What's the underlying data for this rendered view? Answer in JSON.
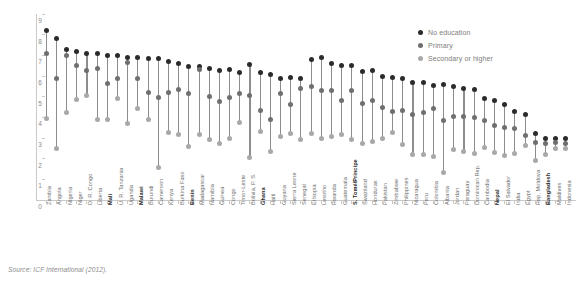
{
  "source_note": "Source: ICF International (2012).",
  "legend": {
    "position": "top-right",
    "entries": [
      {
        "label": "No education",
        "color": "#2b2b2b",
        "key": "no_education"
      },
      {
        "label": "Primary",
        "color": "#6f6f6f",
        "key": "primary"
      },
      {
        "label": "Secondary or higher",
        "color": "#a8a8a8",
        "key": "secondary_or_higher"
      }
    ]
  },
  "chart_data": {
    "type": "scatter",
    "title": "",
    "subtitle": "",
    "xlabel": "",
    "ylabel": "Total fertility rate",
    "ylim": [
      0,
      9
    ],
    "yticks": [
      0,
      1,
      2,
      3,
      4,
      5,
      6,
      7,
      8,
      9
    ],
    "ytick_labels": [
      "0",
      "1",
      "2",
      "3",
      "4",
      "5",
      "6",
      "7",
      "8",
      "9"
    ],
    "grid": false,
    "legend_position": "top-right",
    "categories": [
      "Zambia",
      "Angola",
      "Nigeria",
      "Niger",
      "D. R. Congo",
      "Liberia",
      "Mali",
      "U. R. Tanzania",
      "Uganda",
      "Malawi",
      "Burundi",
      "Cameroon",
      "Kenya",
      "Burkina Faso",
      "Benin",
      "Madagascar",
      "Namibia",
      "Guinea",
      "Congo",
      "Timor-Leste",
      "Bolivia, P. S.",
      "Ghana",
      "Haiti",
      "Guyana",
      "Sierra Leone",
      "Senegal",
      "Ethiopia",
      "Lesotho",
      "Rwanda",
      "Guatemala",
      "S. Tomé/Principe",
      "Swaziland",
      "Honduras",
      "Pakistan",
      "Zimbabwe",
      "Philippines",
      "Nicaragua",
      "Peru",
      "Colombia",
      "Albania",
      "Jordan",
      "Paraguay",
      "Dominican Rep.",
      "Cambodia",
      "Nepal",
      "El Salvador",
      "India",
      "Egypt",
      "Rep. Moldova",
      "Bangladesh",
      "Maldives",
      "Indonesia"
    ],
    "bold_categories": [
      "Mali",
      "Malawi",
      "Benin",
      "Ghana",
      "S. Tomé/Principe",
      "Nepal",
      "Bangladesh"
    ],
    "series": [
      {
        "name": "No education",
        "color": "#2b2b2b",
        "values": [
          8.2,
          7.8,
          7.3,
          7.2,
          7.1,
          7.1,
          7.0,
          7.0,
          6.9,
          6.9,
          6.85,
          6.85,
          6.7,
          6.6,
          6.45,
          6.45,
          6.35,
          6.25,
          6.3,
          6.15,
          6.55,
          6.15,
          6.05,
          5.9,
          5.95,
          5.9,
          6.8,
          6.9,
          6.6,
          6.5,
          6.5,
          6.2,
          6.25,
          6.0,
          5.95,
          5.9,
          5.7,
          5.7,
          5.55,
          5.6,
          5.5,
          5.4,
          5.35,
          4.9,
          4.8,
          4.6,
          4.3,
          4.15,
          3.2,
          3.0,
          3.0,
          3.0
        ]
      },
      {
        "name": "Primary",
        "color": "#6f6f6f",
        "values": [
          7.1,
          5.9,
          7.0,
          6.5,
          6.25,
          6.35,
          5.65,
          5.9,
          6.65,
          5.9,
          5.2,
          4.95,
          5.2,
          5.35,
          5.15,
          6.3,
          5.0,
          4.75,
          4.95,
          5.15,
          5.05,
          4.35,
          3.9,
          5.15,
          4.6,
          5.4,
          5.5,
          5.3,
          5.3,
          4.8,
          5.3,
          4.65,
          4.8,
          4.5,
          4.3,
          4.35,
          4.15,
          4.25,
          4.45,
          3.85,
          4.05,
          4.05,
          4.0,
          3.85,
          3.6,
          3.5,
          3.45,
          3.1,
          2.8,
          2.75,
          2.8,
          2.75
        ]
      },
      {
        "name": "Secondary or higher",
        "color": "#a8a8a8",
        "values": [
          3.95,
          2.5,
          4.25,
          4.85,
          5.05,
          3.9,
          3.9,
          4.9,
          3.7,
          4.45,
          3.9,
          1.55,
          3.25,
          3.15,
          2.6,
          3.15,
          2.95,
          2.75,
          3.0,
          3.75,
          2.05,
          3.3,
          2.35,
          3.05,
          3.2,
          2.95,
          3.2,
          3.0,
          3.05,
          3.15,
          2.95,
          2.75,
          2.85,
          3.0,
          3.25,
          2.7,
          2.2,
          2.2,
          2.1,
          1.35,
          2.45,
          2.35,
          2.25,
          2.55,
          2.3,
          2.15,
          2.25,
          2.65,
          1.9,
          2.2,
          2.5,
          2.5
        ]
      }
    ]
  }
}
